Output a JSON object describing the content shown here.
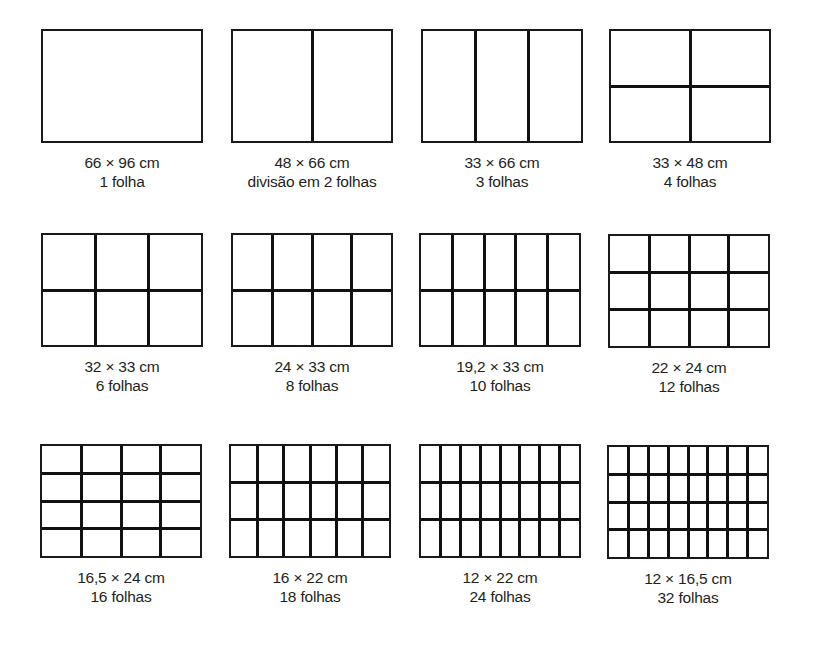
{
  "diagram": {
    "title": "",
    "line_color": "#111111",
    "background": "#ffffff",
    "formats": [
      {
        "size": "66 × 96 cm",
        "sheets": "1 folha",
        "cols": 1,
        "rows": 1
      },
      {
        "size": "48 × 66 cm",
        "sheets": "divisão em 2 folhas",
        "cols": 2,
        "rows": 1
      },
      {
        "size": "33 × 66 cm",
        "sheets": "3 folhas",
        "cols": 3,
        "rows": 1
      },
      {
        "size": "33 × 48 cm",
        "sheets": "4 folhas",
        "cols": 2,
        "rows": 2
      },
      {
        "size": "32 × 33 cm",
        "sheets": "6 folhas",
        "cols": 3,
        "rows": 2
      },
      {
        "size": "24 × 33 cm",
        "sheets": "8 folhas",
        "cols": 4,
        "rows": 2
      },
      {
        "size": "19,2 × 33 cm",
        "sheets": "10 folhas",
        "cols": 5,
        "rows": 2
      },
      {
        "size": "22 × 24 cm",
        "sheets": "12 folhas",
        "cols": 4,
        "rows": 3
      },
      {
        "size": "16,5 × 24 cm",
        "sheets": "16 folhas",
        "cols": 4,
        "rows": 4
      },
      {
        "size": "16 × 22 cm",
        "sheets": "18 folhas",
        "cols": 6,
        "rows": 3
      },
      {
        "size": "12 × 22 cm",
        "sheets": "24 folhas",
        "cols": 8,
        "rows": 3
      },
      {
        "size": "12 × 16,5 cm",
        "sheets": "32 folhas",
        "cols": 8,
        "rows": 4
      }
    ]
  }
}
